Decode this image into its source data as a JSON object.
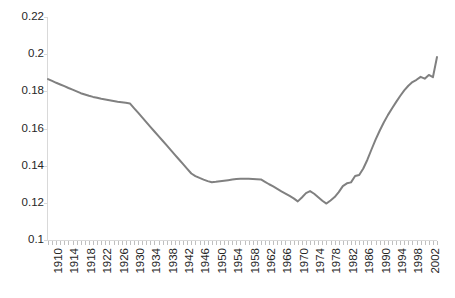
{
  "chart_data": {
    "type": "line",
    "title": "",
    "subtitle": "",
    "xlabel": "",
    "ylabel": "",
    "xlim": [
      1910,
      2005
    ],
    "ylim": [
      0.1,
      0.22
    ],
    "grid": false,
    "legend": false,
    "legend_position": "none",
    "y_ticks": [
      "0.1",
      "0.12",
      "0.14",
      "0.16",
      "0.18",
      "0.2",
      "0.22"
    ],
    "y_tick_values": [
      0.1,
      0.12,
      0.14,
      0.16,
      0.18,
      0.2,
      0.22
    ],
    "x_ticks": [
      "1910",
      "1914",
      "1918",
      "1922",
      "1926",
      "1930",
      "1934",
      "1938",
      "1942",
      "1946",
      "1950",
      "1954",
      "1958",
      "1962",
      "1966",
      "1970",
      "1974",
      "1978",
      "1982",
      "1986",
      "1990",
      "1994",
      "1998",
      "2002"
    ],
    "x_tick_values": [
      1910,
      1914,
      1918,
      1922,
      1926,
      1930,
      1934,
      1938,
      1942,
      1946,
      1950,
      1954,
      1958,
      1962,
      1966,
      1970,
      1974,
      1978,
      1982,
      1986,
      1990,
      1994,
      1998,
      2002
    ],
    "x_minor_tick_step": 1,
    "line_color": "#808080",
    "line_width": 2,
    "series": [
      {
        "name": "series-1",
        "x": [
          1910,
          1911,
          1912,
          1913,
          1914,
          1915,
          1916,
          1917,
          1918,
          1919,
          1920,
          1921,
          1922,
          1923,
          1924,
          1925,
          1926,
          1927,
          1928,
          1929,
          1930,
          1931,
          1932,
          1933,
          1934,
          1935,
          1936,
          1937,
          1938,
          1939,
          1940,
          1941,
          1942,
          1943,
          1944,
          1945,
          1946,
          1947,
          1948,
          1949,
          1950,
          1951,
          1952,
          1953,
          1954,
          1955,
          1956,
          1957,
          1958,
          1959,
          1960,
          1961,
          1962,
          1963,
          1964,
          1965,
          1966,
          1967,
          1968,
          1969,
          1970,
          1971,
          1972,
          1973,
          1974,
          1975,
          1976,
          1977,
          1978,
          1979,
          1980,
          1981,
          1982,
          1983,
          1984,
          1985,
          1986,
          1987,
          1988,
          1989,
          1990,
          1991,
          1992,
          1993,
          1994,
          1995,
          1996,
          1997,
          1998,
          1999,
          2000,
          2001,
          2002,
          2003,
          2004,
          2005
        ],
        "values": [
          0.1866,
          0.1856,
          0.1846,
          0.1837,
          0.1828,
          0.1818,
          0.1809,
          0.18,
          0.179,
          0.1783,
          0.1776,
          0.177,
          0.1765,
          0.176,
          0.1756,
          0.1752,
          0.1748,
          0.1744,
          0.1741,
          0.1738,
          0.1735,
          0.171,
          0.1685,
          0.166,
          0.1634,
          0.1609,
          0.1584,
          0.1559,
          0.1534,
          0.1509,
          0.1484,
          0.1458,
          0.1433,
          0.1408,
          0.1383,
          0.1358,
          0.1344,
          0.1334,
          0.1325,
          0.1317,
          0.1311,
          0.1313,
          0.1316,
          0.1319,
          0.1322,
          0.1325,
          0.1328,
          0.133,
          0.133,
          0.1329,
          0.1328,
          0.1327,
          0.1326,
          0.1313,
          0.13,
          0.1288,
          0.1275,
          0.1262,
          0.125,
          0.1237,
          0.1224,
          0.1208,
          0.1229,
          0.1252,
          0.1263,
          0.1249,
          0.123,
          0.1211,
          0.1196,
          0.1213,
          0.1231,
          0.1258,
          0.129,
          0.1305,
          0.131,
          0.1344,
          0.135,
          0.1385,
          0.1432,
          0.1487,
          0.154,
          0.1588,
          0.1632,
          0.1672,
          0.1708,
          0.1742,
          0.1775,
          0.1805,
          0.183,
          0.185,
          0.1862,
          0.1878,
          0.1868,
          0.1888,
          0.1876,
          0.1985
        ]
      }
    ]
  }
}
